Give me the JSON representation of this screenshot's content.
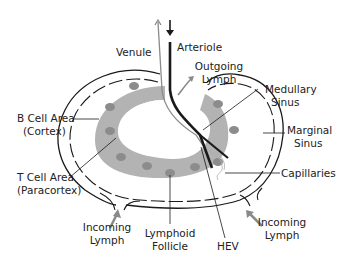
{
  "diagram": {
    "type": "lymph node anatomy",
    "colors": {
      "outline": "#1a1a1a",
      "paracortex_fill": "#b3b3b3",
      "follicle_fill": "#8c8c8c",
      "arrow_gray": "#8a8a8a",
      "background": "#ffffff"
    },
    "labels": {
      "venule": "Venule",
      "arteriole": "Arteriole",
      "outgoing_lymph_1": "Outgoing",
      "outgoing_lymph_2": "Lymph",
      "medullary_sinus_1": "Medullary",
      "medullary_sinus_2": "Sinus",
      "marginal_sinus_1": "Marginal",
      "marginal_sinus_2": "Sinus",
      "capillaries": "Capillaries",
      "b_cell_area_1": "B Cell Area",
      "b_cell_area_2": "(Cortex)",
      "t_cell_area_1": "T Cell Area",
      "t_cell_area_2": "(Paracortex)",
      "incoming_lymph_left_1": "Incoming",
      "incoming_lymph_left_2": "Lymph",
      "lymphoid_follicle_1": "Lymphoid",
      "lymphoid_follicle_2": "Follicle",
      "hev": "HEV",
      "incoming_lymph_right_1": "Incoming",
      "incoming_lymph_right_2": "Lymph"
    }
  }
}
